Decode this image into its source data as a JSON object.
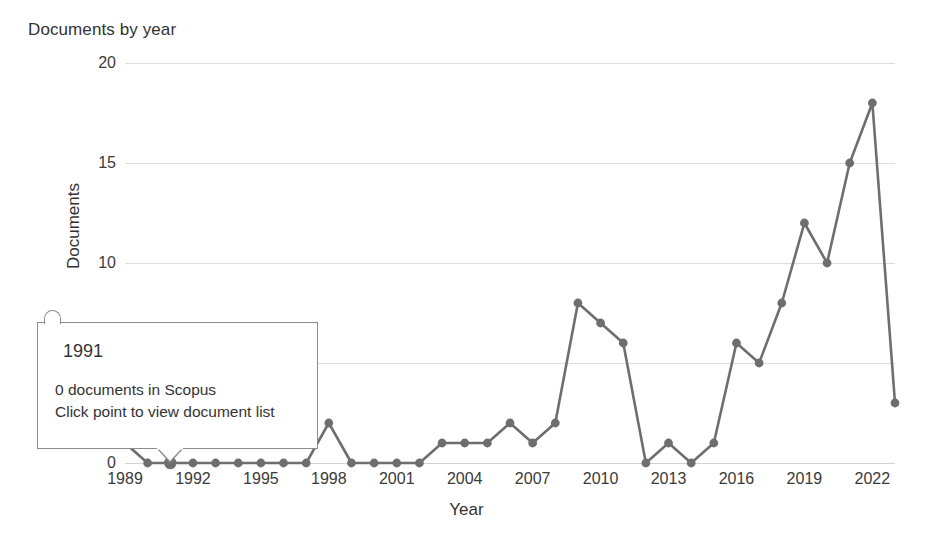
{
  "chart": {
    "title": "Documents by year",
    "xlabel": "Year",
    "ylabel": "Documents"
  },
  "tooltip": {
    "year": "1991",
    "line1": "0 documents in Scopus",
    "line2": "Click point to view document list"
  },
  "style": {
    "line_color": "#6e6e6e",
    "marker_color": "#6e6e6e",
    "grid_color": "#dcdcdc",
    "text_color": "#333333",
    "background": "#ffffff",
    "tooltip_border": "#8c8c8c"
  },
  "chart_data": {
    "type": "line",
    "title": "Documents by year",
    "xlabel": "Year",
    "ylabel": "Documents",
    "xlim": [
      1989,
      2023
    ],
    "ylim": [
      0,
      20
    ],
    "yticks": [
      0,
      5,
      10,
      15,
      20
    ],
    "xticks": [
      1989,
      1992,
      1995,
      1998,
      2001,
      2004,
      2007,
      2010,
      2013,
      2016,
      2019,
      2022
    ],
    "grid": "horizontal",
    "legend": "none",
    "markers": true,
    "highlighted_point": {
      "x": 1991,
      "y": 0
    },
    "x": [
      1989,
      1990,
      1991,
      1992,
      1993,
      1994,
      1995,
      1996,
      1997,
      1998,
      1999,
      2000,
      2001,
      2002,
      2003,
      2004,
      2005,
      2006,
      2007,
      2008,
      2009,
      2010,
      2011,
      2012,
      2013,
      2014,
      2015,
      2016,
      2017,
      2018,
      2019,
      2020,
      2021,
      2022,
      2023
    ],
    "values": [
      1,
      0,
      0,
      0,
      0,
      0,
      0,
      0,
      0,
      2,
      0,
      0,
      0,
      0,
      1,
      1,
      1,
      2,
      1,
      2,
      8,
      7,
      6,
      0,
      1,
      0,
      1,
      6,
      5,
      8,
      12,
      10,
      15,
      18,
      3
    ],
    "series": [
      {
        "name": "Documents",
        "values": [
          1,
          0,
          0,
          0,
          0,
          0,
          0,
          0,
          0,
          2,
          0,
          0,
          0,
          0,
          1,
          1,
          1,
          2,
          1,
          2,
          8,
          7,
          6,
          0,
          1,
          0,
          1,
          6,
          5,
          8,
          12,
          10,
          15,
          18,
          3
        ]
      }
    ]
  }
}
